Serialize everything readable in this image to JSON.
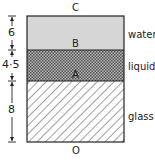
{
  "diagram": {
    "points": {
      "top": "C",
      "water_liquid_interface": "B",
      "liquid_glass_interface": "A",
      "bottom": "O"
    },
    "layers": [
      {
        "name": "water",
        "thickness": "6",
        "fill": "#d6d6d6",
        "pattern": "solid"
      },
      {
        "name": "liquid",
        "thickness": "4.5",
        "fill": "#8a8a8a",
        "pattern": "checker"
      },
      {
        "name": "glass",
        "thickness": "8",
        "fill": "#ffffff",
        "pattern": "diagonal-hatch"
      }
    ],
    "dimension_labels": [
      "6",
      "4·5",
      "8"
    ],
    "material_labels": [
      "water",
      "liquid",
      "glass"
    ]
  }
}
